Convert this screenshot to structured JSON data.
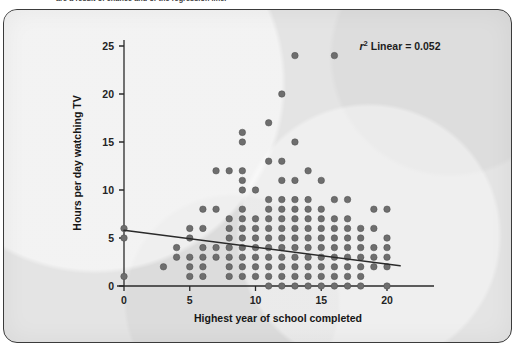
{
  "page": {
    "caption_above": "are a result of chance and of the regression line."
  },
  "figure": {
    "frame_color": "#3b3b3b",
    "background_color": "#e4e4e4"
  },
  "annotation": {
    "r2_prefix": "r",
    "r2_superscript": "2",
    "r2_text": " Linear = 0.052",
    "full_text": "r2 Linear = 0.052"
  },
  "colors": {
    "point": "#6e6e6e",
    "point_stroke": "#4f4f4f",
    "line": "#2a2a2a",
    "axis": "#2a2a2a",
    "text": "#1c1c1c"
  },
  "chart_data": {
    "type": "scatter",
    "title": "",
    "xlabel": "Highest year of school completed",
    "ylabel": "Hours per day watching TV",
    "xlim": [
      -1.6,
      21.8
    ],
    "ylim": [
      -1.6,
      26.8
    ],
    "xticks": [
      0,
      5,
      10,
      15,
      20
    ],
    "yticks": [
      0,
      5,
      10,
      15,
      20,
      25
    ],
    "grid": false,
    "legend": false,
    "r_squared": 0.052,
    "fit_type": "linear",
    "fit_line": {
      "x_start": 0,
      "y_start": 5.8,
      "x_end": 21,
      "y_end": 2.1
    },
    "points": [
      [
        0,
        6
      ],
      [
        0,
        5
      ],
      [
        0,
        1
      ],
      [
        3,
        2
      ],
      [
        4,
        4
      ],
      [
        4,
        3
      ],
      [
        5,
        6
      ],
      [
        5,
        5
      ],
      [
        5,
        3
      ],
      [
        5,
        2
      ],
      [
        5,
        1
      ],
      [
        6,
        8
      ],
      [
        6,
        6
      ],
      [
        6,
        4
      ],
      [
        6,
        3
      ],
      [
        6,
        2
      ],
      [
        6,
        1
      ],
      [
        7,
        12
      ],
      [
        7,
        8
      ],
      [
        7,
        4
      ],
      [
        7,
        3
      ],
      [
        8,
        12
      ],
      [
        8,
        7
      ],
      [
        8,
        6
      ],
      [
        8,
        5
      ],
      [
        8,
        4
      ],
      [
        8,
        3
      ],
      [
        8,
        2
      ],
      [
        8,
        1
      ],
      [
        9,
        16
      ],
      [
        9,
        15
      ],
      [
        9,
        12
      ],
      [
        9,
        11
      ],
      [
        9,
        10
      ],
      [
        9,
        8
      ],
      [
        9,
        7
      ],
      [
        9,
        6
      ],
      [
        9,
        5
      ],
      [
        9,
        4
      ],
      [
        9,
        3
      ],
      [
        9,
        2
      ],
      [
        9,
        1
      ],
      [
        10,
        10
      ],
      [
        10,
        7
      ],
      [
        10,
        6
      ],
      [
        10,
        5
      ],
      [
        10,
        4
      ],
      [
        10,
        3
      ],
      [
        10,
        2
      ],
      [
        10,
        1
      ],
      [
        11,
        17
      ],
      [
        11,
        13
      ],
      [
        11,
        9
      ],
      [
        11,
        8
      ],
      [
        11,
        7
      ],
      [
        11,
        6
      ],
      [
        11,
        5
      ],
      [
        11,
        4
      ],
      [
        11,
        3
      ],
      [
        11,
        2
      ],
      [
        11,
        1
      ],
      [
        11,
        0
      ],
      [
        12,
        20
      ],
      [
        12,
        13
      ],
      [
        12,
        11
      ],
      [
        12,
        9
      ],
      [
        12,
        8
      ],
      [
        12,
        7
      ],
      [
        12,
        6
      ],
      [
        12,
        5
      ],
      [
        12,
        4
      ],
      [
        12,
        3
      ],
      [
        12,
        2
      ],
      [
        12,
        1
      ],
      [
        12,
        0
      ],
      [
        13,
        24
      ],
      [
        13,
        15
      ],
      [
        13,
        11
      ],
      [
        13,
        9
      ],
      [
        13,
        8
      ],
      [
        13,
        7
      ],
      [
        13,
        6
      ],
      [
        13,
        5
      ],
      [
        13,
        4
      ],
      [
        13,
        3
      ],
      [
        13,
        2
      ],
      [
        13,
        1
      ],
      [
        13,
        0
      ],
      [
        14,
        12
      ],
      [
        14,
        9
      ],
      [
        14,
        8
      ],
      [
        14,
        7
      ],
      [
        14,
        6
      ],
      [
        14,
        5
      ],
      [
        14,
        4
      ],
      [
        14,
        3
      ],
      [
        14,
        2
      ],
      [
        14,
        1
      ],
      [
        14,
        0
      ],
      [
        15,
        11
      ],
      [
        15,
        8
      ],
      [
        15,
        7
      ],
      [
        15,
        6
      ],
      [
        15,
        5
      ],
      [
        15,
        4
      ],
      [
        15,
        3
      ],
      [
        15,
        2
      ],
      [
        15,
        1
      ],
      [
        15,
        0
      ],
      [
        16,
        24
      ],
      [
        16,
        9
      ],
      [
        16,
        7
      ],
      [
        16,
        6
      ],
      [
        16,
        5
      ],
      [
        16,
        4
      ],
      [
        16,
        3
      ],
      [
        16,
        2
      ],
      [
        16,
        1
      ],
      [
        16,
        0
      ],
      [
        17,
        9
      ],
      [
        17,
        7
      ],
      [
        17,
        6
      ],
      [
        17,
        5
      ],
      [
        17,
        4
      ],
      [
        17,
        3
      ],
      [
        17,
        2
      ],
      [
        17,
        1
      ],
      [
        17,
        0
      ],
      [
        18,
        6
      ],
      [
        18,
        5
      ],
      [
        18,
        4
      ],
      [
        18,
        3
      ],
      [
        18,
        2
      ],
      [
        18,
        1
      ],
      [
        18,
        0
      ],
      [
        19,
        8
      ],
      [
        19,
        6
      ],
      [
        19,
        4
      ],
      [
        19,
        3
      ],
      [
        19,
        2
      ],
      [
        20,
        8
      ],
      [
        20,
        5
      ],
      [
        20,
        4
      ],
      [
        20,
        3
      ],
      [
        20,
        2
      ],
      [
        20,
        0
      ]
    ]
  }
}
